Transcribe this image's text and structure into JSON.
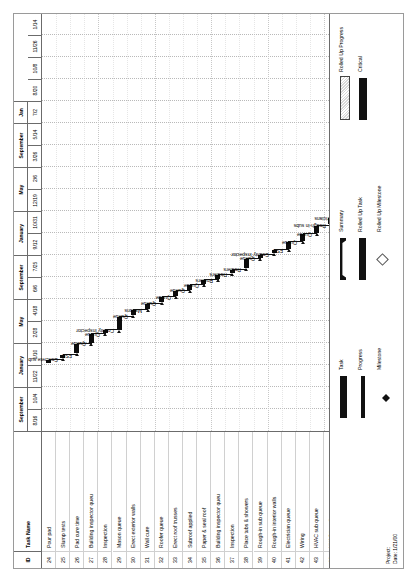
{
  "document": {
    "type": "gantt-chart",
    "orientation": "rotated-90-ccw"
  },
  "table": {
    "headers": {
      "id": "ID",
      "name": "Task Name"
    },
    "rows": [
      {
        "id": "24",
        "name": "Pour pad"
      },
      {
        "id": "25",
        "name": "Slump tests"
      },
      {
        "id": "26",
        "name": "Pad cure time"
      },
      {
        "id": "27",
        "name": "Building inspector queu"
      },
      {
        "id": "28",
        "name": "Inspection"
      },
      {
        "id": "29",
        "name": "Mason queue"
      },
      {
        "id": "30",
        "name": "Erect exterior walls"
      },
      {
        "id": "31",
        "name": "Wall cure"
      },
      {
        "id": "32",
        "name": "Roofer queue"
      },
      {
        "id": "33",
        "name": "Erect roof trusses"
      },
      {
        "id": "34",
        "name": "Subroof applied"
      },
      {
        "id": "35",
        "name": "Paper & seal roof"
      },
      {
        "id": "36",
        "name": "Building inspector queu"
      },
      {
        "id": "37",
        "name": "Inspection"
      },
      {
        "id": "38",
        "name": "Place tubs & showers"
      },
      {
        "id": "39",
        "name": "Rough-in sub queue"
      },
      {
        "id": "40",
        "name": "Rough-in interior walls"
      },
      {
        "id": "41",
        "name": "Electrician queue"
      },
      {
        "id": "42",
        "name": "Wiring"
      },
      {
        "id": "43",
        "name": "HVAC sub queue"
      },
      {
        "id": "44",
        "name": "HVAC install"
      },
      {
        "id": "45",
        "name": "Pour pads"
      },
      {
        "id": "46",
        "name": "Pad cure"
      }
    ]
  },
  "timeline": {
    "major": [
      {
        "label": "September",
        "span": 2
      },
      {
        "label": "January",
        "span": 2
      },
      {
        "label": "May",
        "span": 2
      },
      {
        "label": "September",
        "span": 2
      },
      {
        "label": "January",
        "span": 2
      },
      {
        "label": "May",
        "span": 2
      },
      {
        "label": "September",
        "span": 2
      },
      {
        "label": "Jan",
        "span": 1
      }
    ],
    "minor": [
      "8/16",
      "10/4",
      "11/22",
      "1/10",
      "2/28",
      "4/18",
      "6/6",
      "7/25",
      "9/12",
      "10/31",
      "12/19",
      "2/6",
      "3/26",
      "5/14",
      "7/2",
      "8/20",
      "10/8",
      "11/26",
      "1/14"
    ]
  },
  "chart_data": {
    "type": "bar",
    "xlabel": "",
    "ylabel": "",
    "bars": [
      {
        "task": "Pour pad",
        "label": "Concrete sub",
        "start": 3.1,
        "duration": 0.1
      },
      {
        "task": "Slump tests",
        "label": "FSD",
        "start": 3.3,
        "duration": 0.08
      },
      {
        "task": "Pad cure time",
        "label": "Queue",
        "start": 3.55,
        "duration": 0.42
      },
      {
        "task": "Building inspector queu",
        "label": "Queue",
        "start": 4.0,
        "duration": 0.4
      },
      {
        "task": "Inspection",
        "label": "County Inspector",
        "start": 4.45,
        "duration": 0.1
      },
      {
        "task": "Mason queue",
        "label": "Queue",
        "start": 4.6,
        "duration": 0.6
      },
      {
        "task": "Erect exterior walls",
        "label": "Masons",
        "start": 5.25,
        "duration": 0.24
      },
      {
        "task": "Wall cure",
        "label": "Queue",
        "start": 5.55,
        "duration": 0.24
      },
      {
        "task": "Roofer queue",
        "label": "Queue",
        "start": 5.85,
        "duration": 0.24
      },
      {
        "task": "Erect roof trusses",
        "label": "Queue",
        "start": 6.15,
        "duration": 0.22
      },
      {
        "task": "Subroof applied",
        "label": "Queue",
        "start": 6.42,
        "duration": 0.2
      },
      {
        "task": "Paper & seal roof",
        "label": "Roofers",
        "start": 6.68,
        "duration": 0.18
      },
      {
        "task": "Building inspector queu",
        "label": "Roofers",
        "start": 6.92,
        "duration": 0.18
      },
      {
        "task": "Inspection",
        "label": "Roofers",
        "start": 7.16,
        "duration": 0.16
      },
      {
        "task": "Place tubs & showers",
        "label": "Queue",
        "start": 7.4,
        "duration": 0.42
      },
      {
        "task": "Rough-in sub queue",
        "label": "County Inspector",
        "start": 7.88,
        "duration": 0.12
      },
      {
        "task": "Rough-in interior walls",
        "label": "FSD",
        "start": 8.08,
        "duration": 0.1
      },
      {
        "task": "Electrician queue",
        "label": "Queue",
        "start": 8.26,
        "duration": 0.32
      },
      {
        "task": "Wiring",
        "label": "Queue",
        "start": 8.64,
        "duration": 0.3
      },
      {
        "task": "HVAC sub queue",
        "label": "Rough-in subs",
        "start": 9.0,
        "duration": 0.34
      },
      {
        "task": "HVAC install",
        "label": "Electricians",
        "start": 9.42,
        "duration": 0.26
      },
      {
        "task": "Pour pads",
        "label": "HVAC sub",
        "start": 9.76,
        "duration": 0.22
      },
      {
        "task": "Pad cure",
        "label": "HVAC sub",
        "start": 10.05,
        "duration": 0.2
      },
      {
        "task": "Pad cure end",
        "label": "Queue",
        "start": 10.34,
        "duration": 0.18
      }
    ],
    "axis_minor_ticks": [
      "8/16",
      "10/4",
      "11/22",
      "1/10",
      "2/28",
      "4/18",
      "6/6",
      "7/25",
      "9/12",
      "10/31",
      "12/19",
      "2/6",
      "3/26",
      "5/14",
      "7/2",
      "8/20",
      "10/8",
      "11/26",
      "1/14"
    ],
    "grid": true,
    "legend_position": "bottom"
  },
  "legend": {
    "column1": [
      {
        "symbol": "task-bar",
        "label": "Task"
      },
      {
        "symbol": "progress-bar",
        "label": "Progress"
      },
      {
        "symbol": "milestone",
        "label": "Milestone"
      }
    ],
    "column2": [
      {
        "symbol": "summary-bar",
        "label": "Summary"
      },
      {
        "symbol": "rolled-up-task",
        "label": "Rolled Up Task"
      },
      {
        "symbol": "rolled-up-milestone",
        "label": "Rolled Up Milestone"
      }
    ],
    "column3": [
      {
        "symbol": "rolled-up-progress",
        "label": "Rolled Up Progress"
      },
      {
        "symbol": "critical-bar",
        "label": "Critical"
      }
    ]
  },
  "footer": {
    "project_label": "Project:",
    "date_label": "Date: 1/21/00"
  }
}
